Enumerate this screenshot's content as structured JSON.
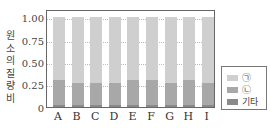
{
  "chart_data": {
    "type": "bar",
    "stacked": true,
    "title": "",
    "xlabel": "",
    "ylabel": "원소의 질량비",
    "ylim": [
      0,
      1.0
    ],
    "yticks": [
      "0",
      "0.25",
      "0.50",
      "0.75",
      "1.00"
    ],
    "categories": [
      "A",
      "B",
      "C",
      "D",
      "E",
      "F",
      "G",
      "H",
      "I"
    ],
    "series": [
      {
        "name": "기타",
        "color": "#8a8a8a",
        "values": [
          0.02,
          0.02,
          0.02,
          0.02,
          0.02,
          0.02,
          0.02,
          0.02,
          0.02
        ]
      },
      {
        "name": "㉡",
        "color": "#a8a8a8",
        "values": [
          0.28,
          0.25,
          0.25,
          0.25,
          0.28,
          0.28,
          0.25,
          0.28,
          0.25
        ]
      },
      {
        "name": "㉠",
        "color": "#cfcfcf",
        "values": [
          0.7,
          0.73,
          0.73,
          0.73,
          0.7,
          0.7,
          0.73,
          0.7,
          0.73
        ]
      }
    ],
    "grid": "horizontal dotted",
    "legend_position": "right-bottom"
  },
  "axis": {
    "ylabel_chars": [
      "원",
      "소",
      "의",
      "질",
      "량",
      "비"
    ]
  },
  "legend": [
    {
      "label": "㉠",
      "color": "#cfcfcf"
    },
    {
      "label": "㉡",
      "color": "#a8a8a8"
    },
    {
      "label": "기타",
      "color": "#8a8a8a"
    }
  ]
}
